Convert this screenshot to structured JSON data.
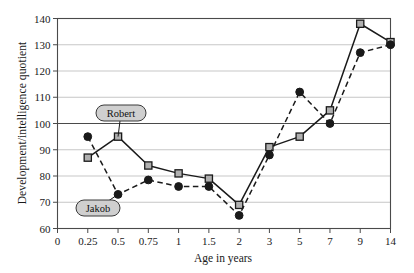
{
  "chart_data": {
    "type": "line",
    "title": "",
    "xlabel": "Age in years",
    "ylabel": "Development/intelligence quotient",
    "categories": [
      "0",
      "0.25",
      "0.5",
      "0.75",
      "1",
      "1.5",
      "2",
      "3",
      "5",
      "7",
      "9",
      "14"
    ],
    "x_tick_labels": [
      "0",
      "0.25",
      "0.5",
      "0.75",
      "1",
      "1.5",
      "2",
      "3",
      "5",
      "7",
      "9",
      "14"
    ],
    "y_tick_labels": [
      "60",
      "70",
      "80",
      "90",
      "100",
      "110",
      "120",
      "130",
      "140"
    ],
    "ylim": [
      60,
      140
    ],
    "ystep": 10,
    "grid": "horizontal",
    "legend": "annotations",
    "series": [
      {
        "name": "Robert",
        "marker": "square-open",
        "line": "solid",
        "color": "#1a1a1a",
        "x": [
          "0.25",
          "0.5",
          "0.75",
          "1",
          "1.5",
          "2",
          "3",
          "5",
          "7",
          "9",
          "14"
        ],
        "values": [
          87,
          95,
          84,
          81,
          79,
          69,
          91,
          95,
          105,
          138,
          131
        ]
      },
      {
        "name": "Jakob",
        "marker": "circle-filled",
        "line": "dashed",
        "color": "#1a1a1a",
        "x": [
          "0.25",
          "0.5",
          "0.75",
          "1",
          "1.5",
          "2",
          "3",
          "5",
          "7",
          "9",
          "14"
        ],
        "values": [
          95,
          73,
          78.5,
          76,
          76,
          65,
          88,
          112,
          100,
          127,
          130
        ]
      }
    ],
    "annotations": [
      {
        "label": "Robert",
        "series": "Robert",
        "points_to": {
          "x": "0.5",
          "y": 95
        }
      },
      {
        "label": "Jakob",
        "series": "Jakob",
        "points_to": {
          "x": "0.5",
          "y": 73
        }
      }
    ]
  },
  "axis": {
    "y_title": "Development/intelligence quotient",
    "x_title": "Age in years"
  },
  "callouts": {
    "robert": "Robert",
    "jakob": "Jakob"
  },
  "colors": {
    "line": "#1a1a1a",
    "grid": "#b9b9b9",
    "frame": "#4a4a4a",
    "callout_fill": "#cfcfcf",
    "marker_fill": "#b0b0b0",
    "background": "#ffffff"
  }
}
